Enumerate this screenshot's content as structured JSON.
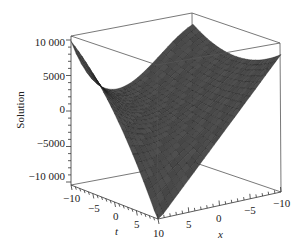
{
  "chart_data": {
    "type": "surface3d",
    "title": "",
    "zlabel": "Solution",
    "xlabel": "x",
    "tlabel": "t",
    "z_ticks": [
      "10 000",
      "5000",
      "0",
      "−5000",
      "−10 000"
    ],
    "z_tick_values": [
      10000,
      5000,
      0,
      -5000,
      -10000
    ],
    "zlim": [
      -10000,
      10000
    ],
    "t_ticks": [
      "−10",
      "−5",
      "0",
      "5",
      "10"
    ],
    "t_tick_values": [
      -10,
      -5,
      0,
      5,
      10
    ],
    "tlim": [
      -10,
      10
    ],
    "x_ticks": [
      "10",
      "5",
      "0",
      "−5",
      "−10"
    ],
    "x_tick_values": [
      10,
      5,
      0,
      -5,
      -10
    ],
    "xlim": [
      -10,
      10
    ],
    "surface_description": "Saddle-like surface: high (~10000) at t=-10,x=10 corner, near 0 along middle, rising to ~7500 at t=-10,x=-10 edge, and dropping to ~-10000 at t=10,x=10 corner",
    "surface_color": "#4a4a4a",
    "mesh_color": "#1a1a1a",
    "box": true,
    "grid": false
  }
}
